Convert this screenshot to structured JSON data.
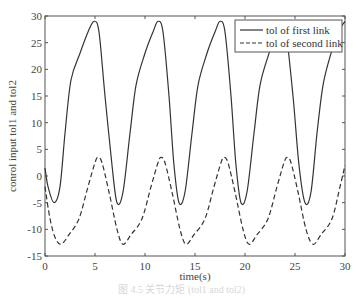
{
  "chart_data": {
    "type": "line",
    "title": "",
    "xlabel": "time(s)",
    "ylabel": "conrol input tol1 and tol2",
    "xlim": [
      0,
      30
    ],
    "ylim": [
      -15,
      30
    ],
    "xticks": [
      0,
      5,
      10,
      15,
      20,
      25,
      30
    ],
    "yticks": [
      -15,
      -10,
      -5,
      0,
      5,
      10,
      15,
      20,
      25,
      30
    ],
    "grid": false,
    "legend_position": "upper right",
    "series": [
      {
        "name": "tol of first link",
        "style": "solid",
        "color": "#333333",
        "x": [
          0,
          0.3,
          0.9,
          1.5,
          2.0,
          2.6,
          3.5,
          4.3,
          4.9,
          5.4,
          6.0,
          6.7,
          7.2,
          7.8,
          8.5,
          9.1,
          10.0,
          10.8,
          11.3,
          11.8,
          12.4,
          12.9,
          13.4,
          14.0,
          14.7,
          15.3,
          16.2,
          17.0,
          17.5,
          18.0,
          18.6,
          19.1,
          19.6,
          20.2,
          20.9,
          21.5,
          22.4,
          23.1,
          23.6,
          24.1,
          24.8,
          25.4,
          26.0,
          26.6,
          27.2,
          27.8,
          28.6,
          29.3,
          30.0
        ],
        "y": [
          1.5,
          -2,
          -5,
          -2,
          8,
          18,
          23,
          27,
          29,
          27,
          15,
          2,
          -5,
          -3,
          8,
          17,
          23,
          27,
          29,
          27,
          15,
          2,
          -5,
          -3,
          8,
          17,
          23,
          27,
          29,
          27,
          15,
          2,
          -5,
          -3,
          8,
          17,
          23,
          27,
          29,
          27,
          15,
          2,
          -5,
          -3,
          8,
          17,
          23,
          27,
          29
        ]
      },
      {
        "name": "tol of second link",
        "style": "dashed",
        "color": "#333333",
        "x": [
          0,
          0.5,
          1.0,
          1.6,
          2.4,
          3.4,
          4.3,
          5.0,
          5.3,
          5.7,
          6.4,
          7.2,
          7.8,
          8.6,
          9.7,
          10.6,
          11.3,
          11.6,
          12.0,
          12.7,
          13.5,
          14.1,
          14.9,
          16.0,
          16.9,
          17.6,
          17.9,
          18.3,
          19.0,
          19.8,
          20.4,
          21.2,
          22.3,
          23.2,
          23.9,
          24.2,
          24.6,
          25.3,
          26.1,
          26.8,
          27.6,
          28.7,
          29.5,
          30.0
        ],
        "y": [
          -2,
          -8,
          -11.5,
          -12.8,
          -11,
          -8,
          -2,
          2.5,
          3.5,
          2.5,
          -3,
          -10,
          -12.8,
          -11,
          -8,
          -2,
          2.5,
          3.5,
          2.5,
          -3,
          -10,
          -12.8,
          -11,
          -8,
          -2,
          2.5,
          3.5,
          2.5,
          -3,
          -10,
          -12.8,
          -11,
          -8,
          -2,
          2.5,
          3.5,
          2.5,
          -3,
          -10,
          -12.8,
          -11,
          -8,
          -2,
          2
        ]
      }
    ]
  },
  "caption": "图 4.5  关节力矩 (tol1 and tol2)"
}
